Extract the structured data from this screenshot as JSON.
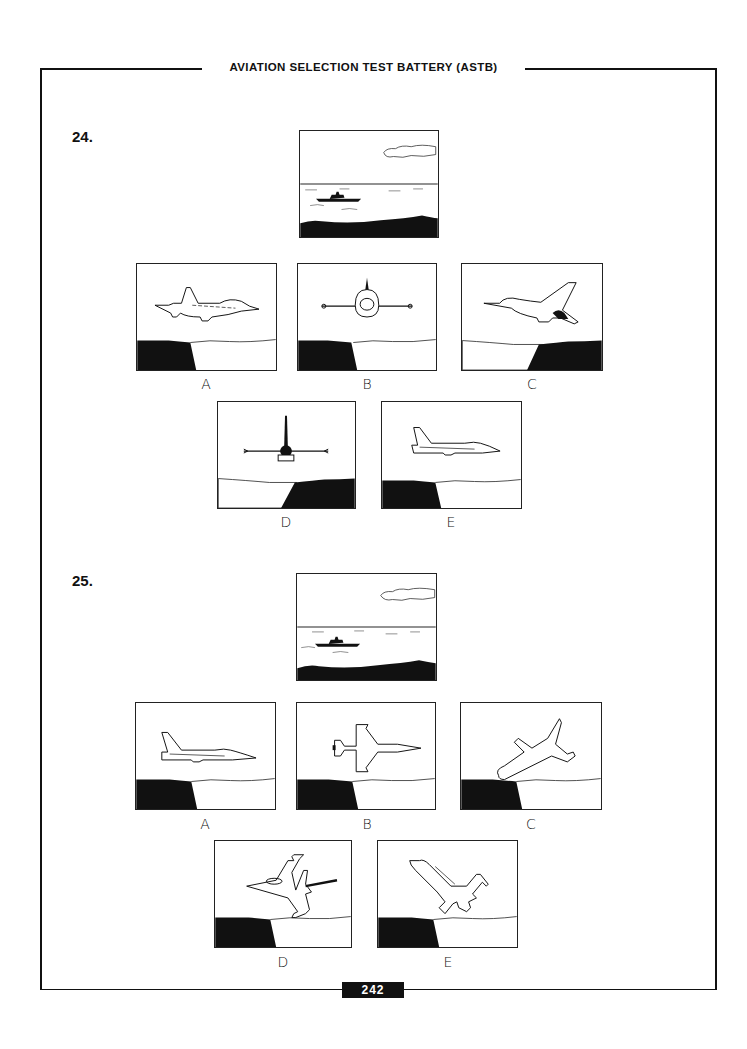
{
  "header": {
    "title": "AVIATION SELECTION TEST BATTERY (ASTB)"
  },
  "questions": [
    {
      "number": "24.",
      "reference_image": "ship-on-sea-with-cloud",
      "options": [
        {
          "label": "A",
          "image": "jet-side-view-facing-right-level"
        },
        {
          "label": "B",
          "image": "jet-head-on-level"
        },
        {
          "label": "C",
          "image": "jet-climbing-rear-quarter"
        },
        {
          "label": "D",
          "image": "jet-rear-view-level"
        },
        {
          "label": "E",
          "image": "jet-side-view-facing-right-level-alt"
        }
      ]
    },
    {
      "number": "25.",
      "reference_image": "ship-on-sea-with-cloud",
      "options": [
        {
          "label": "A",
          "image": "jet-side-view-facing-right-level"
        },
        {
          "label": "B",
          "image": "jet-top-view-facing-right"
        },
        {
          "label": "C",
          "image": "jet-banked-diving-left"
        },
        {
          "label": "D",
          "image": "jet-underside-banked"
        },
        {
          "label": "E",
          "image": "jet-diving-nose-up-left"
        }
      ]
    }
  ],
  "footer": {
    "page_number": "242"
  },
  "colors": {
    "ink": "#111111",
    "paper": "#ffffff"
  }
}
